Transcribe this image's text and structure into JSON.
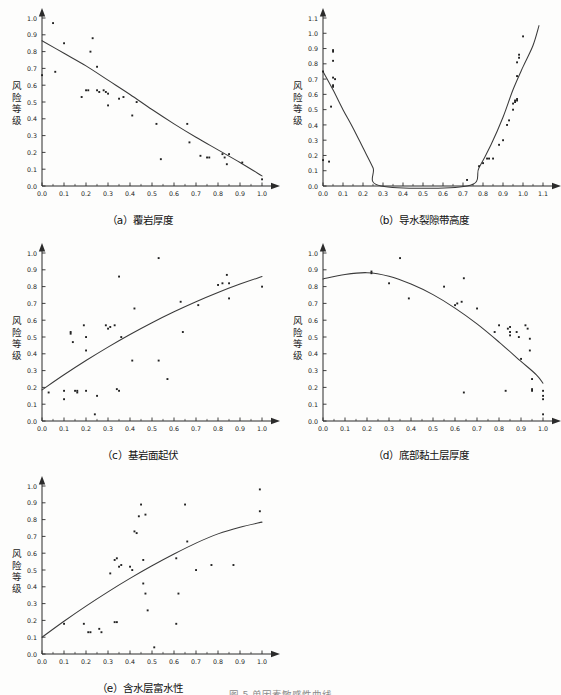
{
  "figure": {
    "bottom_caption": "图 5  单因素敏感性曲线",
    "y_axis_label_chars": [
      "风",
      "险",
      "等",
      "级"
    ],
    "axis_color": "#2b2b2b",
    "curve_color": "#3a3a3a",
    "point_color": "#222222"
  },
  "chart_data": [
    {
      "id": "a",
      "type": "scatter",
      "title": "（a）覆岩厚度",
      "xlabel": "覆岩厚度",
      "ylabel": "风险等级",
      "xlim": [
        0.0,
        1.0
      ],
      "ylim": [
        0.0,
        1.0
      ],
      "xticks": [
        "0.0",
        "0.1",
        "0.2",
        "0.3",
        "0.4",
        "0.5",
        "0.6",
        "0.7",
        "0.8",
        "0.9",
        "1.0"
      ],
      "yticks": [
        "0.0",
        "0.1",
        "0.2",
        "0.3",
        "0.4",
        "0.5",
        "0.6",
        "0.7",
        "0.8",
        "0.9",
        "1.0"
      ],
      "grid": false,
      "legend": "none",
      "points": [
        [
          0.0,
          0.66
        ],
        [
          0.05,
          0.97
        ],
        [
          0.06,
          0.68
        ],
        [
          0.1,
          0.85
        ],
        [
          0.18,
          0.53
        ],
        [
          0.2,
          0.57
        ],
        [
          0.21,
          0.57
        ],
        [
          0.22,
          0.8
        ],
        [
          0.23,
          0.88
        ],
        [
          0.25,
          0.71
        ],
        [
          0.25,
          0.57
        ],
        [
          0.26,
          0.56
        ],
        [
          0.28,
          0.57
        ],
        [
          0.29,
          0.56
        ],
        [
          0.3,
          0.55
        ],
        [
          0.3,
          0.48
        ],
        [
          0.35,
          0.52
        ],
        [
          0.37,
          0.53
        ],
        [
          0.41,
          0.42
        ],
        [
          0.43,
          0.5
        ],
        [
          0.52,
          0.37
        ],
        [
          0.54,
          0.16
        ],
        [
          0.66,
          0.37
        ],
        [
          0.67,
          0.26
        ],
        [
          0.72,
          0.18
        ],
        [
          0.75,
          0.17
        ],
        [
          0.76,
          0.17
        ],
        [
          0.82,
          0.19
        ],
        [
          0.83,
          0.17
        ],
        [
          0.84,
          0.13
        ],
        [
          0.85,
          0.19
        ],
        [
          0.91,
          0.14
        ],
        [
          1.0,
          0.04
        ]
      ],
      "curve": {
        "description": "decreasing convex curve",
        "points": [
          [
            0.0,
            0.865
          ],
          [
            0.1,
            0.79
          ],
          [
            0.2,
            0.715
          ],
          [
            0.3,
            0.63
          ],
          [
            0.4,
            0.545
          ],
          [
            0.5,
            0.455
          ],
          [
            0.6,
            0.37
          ],
          [
            0.7,
            0.29
          ],
          [
            0.8,
            0.215
          ],
          [
            0.9,
            0.14
          ],
          [
            1.0,
            0.06
          ]
        ]
      }
    },
    {
      "id": "b",
      "type": "scatter",
      "title": "（b）导水裂隙带高度",
      "xlabel": "导水裂隙带高度",
      "ylabel": "风险等级",
      "xlim": [
        0.0,
        1.1
      ],
      "ylim": [
        0.0,
        1.1
      ],
      "xticks": [
        "0.0",
        "0.1",
        "0.2",
        "0.3",
        "0.4",
        "0.5",
        "0.6",
        "0.7",
        "0.8",
        "0.9",
        "1.0",
        "1.1"
      ],
      "yticks": [
        "0.0",
        "0.1",
        "0.2",
        "0.3",
        "0.4",
        "0.5",
        "0.6",
        "0.7",
        "0.8",
        "0.9",
        "1.0",
        "1.1"
      ],
      "grid": false,
      "legend": "none",
      "points": [
        [
          0.0,
          0.75
        ],
        [
          0.0,
          0.17
        ],
        [
          0.03,
          0.16
        ],
        [
          0.04,
          0.52
        ],
        [
          0.05,
          0.89
        ],
        [
          0.05,
          0.88
        ],
        [
          0.05,
          0.82
        ],
        [
          0.05,
          0.71
        ],
        [
          0.05,
          0.66
        ],
        [
          0.05,
          0.65
        ],
        [
          0.06,
          0.7
        ],
        [
          0.72,
          0.04
        ],
        [
          0.78,
          0.13
        ],
        [
          0.8,
          0.15
        ],
        [
          0.82,
          0.18
        ],
        [
          0.83,
          0.18
        ],
        [
          0.85,
          0.18
        ],
        [
          0.88,
          0.27
        ],
        [
          0.9,
          0.3
        ],
        [
          0.92,
          0.4
        ],
        [
          0.93,
          0.43
        ],
        [
          0.95,
          0.5
        ],
        [
          0.95,
          0.54
        ],
        [
          0.96,
          0.56
        ],
        [
          0.96,
          0.55
        ],
        [
          0.97,
          0.57
        ],
        [
          0.97,
          0.56
        ],
        [
          0.97,
          0.72
        ],
        [
          0.97,
          0.81
        ],
        [
          0.98,
          0.86
        ],
        [
          0.98,
          0.84
        ],
        [
          1.0,
          0.98
        ]
      ],
      "curve": {
        "description": "U-shaped parabola with minimum near x=0.50, flat zero between 0.29 and 0.72",
        "points": [
          [
            0.0,
            0.75
          ],
          [
            0.05,
            0.63
          ],
          [
            0.1,
            0.5
          ],
          [
            0.15,
            0.38
          ],
          [
            0.2,
            0.25
          ],
          [
            0.25,
            0.12
          ],
          [
            0.29,
            0.0
          ],
          [
            0.72,
            0.0
          ],
          [
            0.78,
            0.12
          ],
          [
            0.84,
            0.27
          ],
          [
            0.9,
            0.45
          ],
          [
            0.95,
            0.63
          ],
          [
            1.0,
            0.78
          ],
          [
            1.05,
            0.92
          ],
          [
            1.08,
            1.05
          ]
        ]
      }
    },
    {
      "id": "c",
      "type": "scatter",
      "title": "（c）基岩面起伏",
      "xlabel": "基岩面起伏",
      "ylabel": "风险等级",
      "xlim": [
        0.0,
        1.0
      ],
      "ylim": [
        0.0,
        1.0
      ],
      "xticks": [
        "0.0",
        "0.1",
        "0.2",
        "0.3",
        "0.4",
        "0.5",
        "0.6",
        "0.7",
        "0.8",
        "0.9",
        "1.0"
      ],
      "yticks": [
        "0.0",
        "0.1",
        "0.2",
        "0.3",
        "0.4",
        "0.5",
        "0.6",
        "0.7",
        "0.8",
        "0.9",
        "1.0"
      ],
      "grid": false,
      "legend": "none",
      "points": [
        [
          0.03,
          0.17
        ],
        [
          0.1,
          0.18
        ],
        [
          0.1,
          0.13
        ],
        [
          0.13,
          0.52
        ],
        [
          0.13,
          0.53
        ],
        [
          0.14,
          0.47
        ],
        [
          0.15,
          0.18
        ],
        [
          0.16,
          0.17
        ],
        [
          0.16,
          0.18
        ],
        [
          0.19,
          0.57
        ],
        [
          0.2,
          0.5
        ],
        [
          0.2,
          0.18
        ],
        [
          0.2,
          0.42
        ],
        [
          0.24,
          0.04
        ],
        [
          0.25,
          0.15
        ],
        [
          0.29,
          0.57
        ],
        [
          0.3,
          0.55
        ],
        [
          0.31,
          0.56
        ],
        [
          0.33,
          0.57
        ],
        [
          0.34,
          0.19
        ],
        [
          0.35,
          0.18
        ],
        [
          0.35,
          0.86
        ],
        [
          0.36,
          0.5
        ],
        [
          0.41,
          0.36
        ],
        [
          0.42,
          0.67
        ],
        [
          0.53,
          0.97
        ],
        [
          0.53,
          0.36
        ],
        [
          0.57,
          0.25
        ],
        [
          0.63,
          0.71
        ],
        [
          0.64,
          0.53
        ],
        [
          0.71,
          0.69
        ],
        [
          0.8,
          0.81
        ],
        [
          0.82,
          0.82
        ],
        [
          0.84,
          0.87
        ],
        [
          0.85,
          0.82
        ],
        [
          0.85,
          0.73
        ],
        [
          1.0,
          0.8
        ]
      ],
      "curve": {
        "description": "increasing concave curve",
        "points": [
          [
            0.0,
            0.185
          ],
          [
            0.1,
            0.275
          ],
          [
            0.2,
            0.36
          ],
          [
            0.3,
            0.44
          ],
          [
            0.4,
            0.515
          ],
          [
            0.5,
            0.585
          ],
          [
            0.6,
            0.65
          ],
          [
            0.7,
            0.71
          ],
          [
            0.8,
            0.765
          ],
          [
            0.9,
            0.815
          ],
          [
            1.0,
            0.86
          ]
        ]
      }
    },
    {
      "id": "d",
      "type": "scatter",
      "title": "（d）底部黏土层厚度",
      "xlabel": "底部黏土层厚度",
      "ylabel": "风险等级",
      "xlim": [
        0.0,
        1.0
      ],
      "ylim": [
        0.0,
        1.0
      ],
      "xticks": [
        "0.0",
        "0.1",
        "0.2",
        "0.3",
        "0.4",
        "0.5",
        "0.6",
        "0.7",
        "0.8",
        "0.9",
        "1.0"
      ],
      "yticks": [
        "0.0",
        "0.1",
        "0.2",
        "0.3",
        "0.4",
        "0.5",
        "0.6",
        "0.7",
        "0.8",
        "0.9",
        "1.0"
      ],
      "grid": false,
      "legend": "none",
      "points": [
        [
          0.22,
          0.88
        ],
        [
          0.22,
          0.89
        ],
        [
          0.3,
          0.82
        ],
        [
          0.35,
          0.97
        ],
        [
          0.39,
          0.73
        ],
        [
          0.55,
          0.8
        ],
        [
          0.6,
          0.69
        ],
        [
          0.61,
          0.7
        ],
        [
          0.63,
          0.71
        ],
        [
          0.64,
          0.85
        ],
        [
          0.64,
          0.17
        ],
        [
          0.7,
          0.67
        ],
        [
          0.78,
          0.53
        ],
        [
          0.8,
          0.57
        ],
        [
          0.83,
          0.18
        ],
        [
          0.84,
          0.55
        ],
        [
          0.85,
          0.56
        ],
        [
          0.85,
          0.53
        ],
        [
          0.85,
          0.51
        ],
        [
          0.88,
          0.53
        ],
        [
          0.89,
          0.5
        ],
        [
          0.9,
          0.37
        ],
        [
          0.92,
          0.57
        ],
        [
          0.93,
          0.55
        ],
        [
          0.94,
          0.49
        ],
        [
          0.94,
          0.42
        ],
        [
          0.95,
          0.25
        ],
        [
          0.95,
          0.18
        ],
        [
          0.95,
          0.19
        ],
        [
          1.0,
          0.18
        ],
        [
          1.0,
          0.15
        ],
        [
          1.0,
          0.13
        ],
        [
          1.0,
          0.04
        ]
      ],
      "curve": {
        "description": "inverted parabola peaking near x=0.20 then decreasing",
        "points": [
          [
            0.0,
            0.845
          ],
          [
            0.1,
            0.872
          ],
          [
            0.2,
            0.883
          ],
          [
            0.3,
            0.862
          ],
          [
            0.4,
            0.815
          ],
          [
            0.5,
            0.752
          ],
          [
            0.6,
            0.672
          ],
          [
            0.7,
            0.578
          ],
          [
            0.8,
            0.47
          ],
          [
            0.9,
            0.355
          ],
          [
            0.97,
            0.275
          ],
          [
            1.0,
            0.225
          ]
        ]
      }
    },
    {
      "id": "e",
      "type": "scatter",
      "title": "（e）含水层富水性",
      "xlabel": "含水层富水性",
      "ylabel": "风险等级",
      "xlim": [
        0.0,
        1.0
      ],
      "ylim": [
        0.0,
        1.0
      ],
      "xticks": [
        "0.0",
        "0.1",
        "0.2",
        "0.3",
        "0.4",
        "0.5",
        "0.6",
        "0.7",
        "0.8",
        "0.9",
        "1.0"
      ],
      "yticks": [
        "0.0",
        "0.1",
        "0.2",
        "0.3",
        "0.4",
        "0.5",
        "0.6",
        "0.7",
        "0.8",
        "0.9",
        "1.0"
      ],
      "grid": false,
      "legend": "none",
      "points": [
        [
          0.1,
          0.18
        ],
        [
          0.19,
          0.18
        ],
        [
          0.21,
          0.13
        ],
        [
          0.22,
          0.13
        ],
        [
          0.26,
          0.15
        ],
        [
          0.27,
          0.13
        ],
        [
          0.31,
          0.48
        ],
        [
          0.33,
          0.19
        ],
        [
          0.33,
          0.56
        ],
        [
          0.34,
          0.57
        ],
        [
          0.34,
          0.19
        ],
        [
          0.35,
          0.52
        ],
        [
          0.36,
          0.53
        ],
        [
          0.4,
          0.52
        ],
        [
          0.41,
          0.5
        ],
        [
          0.42,
          0.73
        ],
        [
          0.43,
          0.72
        ],
        [
          0.44,
          0.82
        ],
        [
          0.45,
          0.89
        ],
        [
          0.46,
          0.56
        ],
        [
          0.46,
          0.42
        ],
        [
          0.47,
          0.83
        ],
        [
          0.47,
          0.36
        ],
        [
          0.48,
          0.26
        ],
        [
          0.51,
          0.04
        ],
        [
          0.61,
          0.18
        ],
        [
          0.61,
          0.57
        ],
        [
          0.62,
          0.36
        ],
        [
          0.65,
          0.89
        ],
        [
          0.66,
          0.67
        ],
        [
          0.7,
          0.5
        ],
        [
          0.77,
          0.53
        ],
        [
          0.87,
          0.53
        ],
        [
          0.99,
          0.98
        ],
        [
          0.99,
          0.85
        ]
      ],
      "curve": {
        "description": "increasing concave curve",
        "points": [
          [
            0.0,
            0.1
          ],
          [
            0.1,
            0.195
          ],
          [
            0.2,
            0.285
          ],
          [
            0.3,
            0.37
          ],
          [
            0.4,
            0.45
          ],
          [
            0.5,
            0.525
          ],
          [
            0.6,
            0.595
          ],
          [
            0.7,
            0.66
          ],
          [
            0.8,
            0.715
          ],
          [
            0.9,
            0.755
          ],
          [
            1.0,
            0.785
          ]
        ]
      }
    }
  ]
}
